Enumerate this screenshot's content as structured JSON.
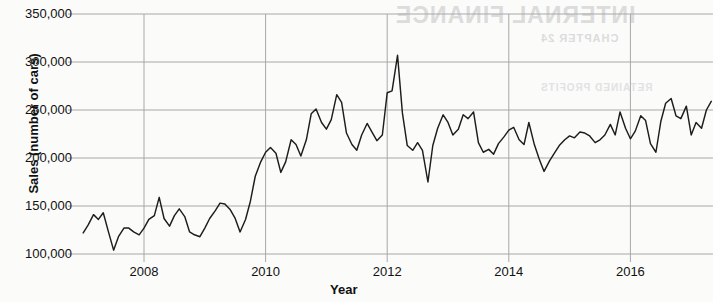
{
  "figure": {
    "background_color": "#fbfbfa",
    "line_color": "#1d1d1d",
    "grid_color": "#a8a8a8",
    "axis_title_color": "#111111"
  },
  "axes": {
    "y_title": "Sales (number of cars)",
    "x_title": "Year",
    "y_ticks": [
      "100,000",
      "150,000",
      "200,000",
      "250,000",
      "300,000",
      "350,000"
    ],
    "x_ticks": [
      "2008",
      "2010",
      "2012",
      "2014",
      "2016"
    ]
  },
  "showthrough": {
    "line1": "INTERNAL FINANCE",
    "line2": "CHAPTER 24",
    "line3": "RETAINED PROFITS"
  },
  "chart_data": {
    "type": "line",
    "title": "",
    "subtitle": "",
    "xlabel": "Year",
    "ylabel": "Sales (number of cars)",
    "xlim": [
      2007.0,
      2017.4
    ],
    "ylim": [
      95000,
      355000
    ],
    "grid": true,
    "legend": "none",
    "y_tick_values": [
      100000,
      150000,
      200000,
      250000,
      300000,
      350000
    ],
    "x_tick_values": [
      2008,
      2010,
      2012,
      2014,
      2016
    ],
    "annotations": [
      {
        "label": "maximum",
        "x": 2012.0,
        "y": 307000
      },
      {
        "label": "post-peak trough",
        "x": 2012.45,
        "y": 175000
      },
      {
        "label": "series start",
        "x": 2007.0,
        "y": 122000
      }
    ],
    "series": [
      {
        "name": "Sales (number of cars)",
        "x": [
          2007.0,
          2007.08,
          2007.17,
          2007.25,
          2007.33,
          2007.42,
          2007.5,
          2007.58,
          2007.67,
          2007.75,
          2007.83,
          2007.92,
          2008.0,
          2008.08,
          2008.17,
          2008.25,
          2008.33,
          2008.42,
          2008.5,
          2008.58,
          2008.67,
          2008.75,
          2008.83,
          2008.92,
          2009.0,
          2009.08,
          2009.17,
          2009.25,
          2009.33,
          2009.42,
          2009.5,
          2009.58,
          2009.67,
          2009.75,
          2009.83,
          2009.92,
          2010.0,
          2010.08,
          2010.17,
          2010.25,
          2010.33,
          2010.42,
          2010.5,
          2010.58,
          2010.67,
          2010.75,
          2010.83,
          2010.92,
          2011.0,
          2011.08,
          2011.17,
          2011.25,
          2011.33,
          2011.42,
          2011.5,
          2011.58,
          2011.67,
          2011.75,
          2011.83,
          2011.92,
          2012.0,
          2012.08,
          2012.17,
          2012.25,
          2012.33,
          2012.42,
          2012.5,
          2012.58,
          2012.67,
          2012.75,
          2012.83,
          2012.92,
          2013.0,
          2013.08,
          2013.17,
          2013.25,
          2013.33,
          2013.42,
          2013.5,
          2013.58,
          2013.67,
          2013.75,
          2013.83,
          2013.92,
          2014.0,
          2014.08,
          2014.17,
          2014.25,
          2014.33,
          2014.42,
          2014.5,
          2014.58,
          2014.67,
          2014.75,
          2014.83,
          2014.92,
          2015.0,
          2015.08,
          2015.17,
          2015.25,
          2015.33,
          2015.42,
          2015.5,
          2015.58,
          2015.67,
          2015.75,
          2015.83,
          2015.92,
          2016.0,
          2016.08,
          2016.17,
          2016.25,
          2016.33,
          2016.42,
          2016.5,
          2016.58,
          2016.67,
          2016.75,
          2016.83,
          2016.92,
          2017.0,
          2017.08,
          2017.17,
          2017.25,
          2017.33
        ],
        "values": [
          122000,
          130000,
          141000,
          136000,
          143000,
          122000,
          104000,
          118000,
          127000,
          127000,
          123000,
          120000,
          127000,
          136000,
          140000,
          159000,
          137000,
          129000,
          140000,
          147000,
          139000,
          123000,
          120000,
          118000,
          127000,
          137000,
          145000,
          153000,
          152000,
          146000,
          137000,
          123000,
          136000,
          155000,
          181000,
          196000,
          206000,
          211000,
          205000,
          185000,
          196000,
          219000,
          214000,
          202000,
          219000,
          246000,
          251000,
          237000,
          230000,
          240000,
          266000,
          258000,
          226000,
          214000,
          208000,
          224000,
          236000,
          227000,
          218000,
          224000,
          268000,
          270000,
          307000,
          247000,
          213000,
          208000,
          216000,
          208000,
          175000,
          213000,
          231000,
          245000,
          237000,
          224000,
          230000,
          245000,
          241000,
          248000,
          216000,
          206000,
          209000,
          204000,
          215000,
          222000,
          229000,
          232000,
          219000,
          214000,
          237000,
          214000,
          199000,
          186000,
          197000,
          205000,
          213000,
          219000,
          223000,
          221000,
          227000,
          226000,
          223000,
          216000,
          219000,
          224000,
          235000,
          224000,
          248000,
          231000,
          220000,
          228000,
          244000,
          239000,
          215000,
          206000,
          238000,
          257000,
          262000,
          244000,
          241000,
          254000,
          224000,
          237000,
          231000,
          250000,
          259000
        ]
      }
    ]
  }
}
